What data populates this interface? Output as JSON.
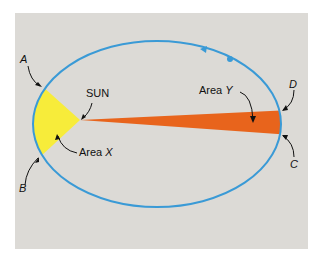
{
  "diagram": {
    "labels": {
      "a": "A",
      "b": "B",
      "c": "C",
      "d": "D",
      "sun": "SUN",
      "area_x_prefix": "Area",
      "area_x_var": "X",
      "area_y_prefix": "Area",
      "area_y_var": "Y"
    },
    "colors": {
      "background": "#dcdad6",
      "orbit": "#3a9ad6",
      "area_x": "#f7ec3a",
      "area_y": "#e8641c",
      "text": "#111111"
    },
    "orbit_direction": "counter-clockwise"
  }
}
